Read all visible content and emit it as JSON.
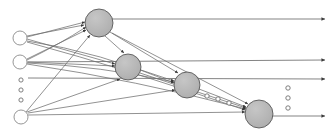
{
  "diagram": {
    "type": "neural-network-graph",
    "canvas": {
      "width": 335,
      "height": 132
    },
    "colors": {
      "background": "#ffffff",
      "hidden_node_fill": "#b4b4b4",
      "hidden_node_stroke": "#4a4a4a",
      "input_node_fill": "#ffffff",
      "input_node_stroke": "#8a8a8a",
      "edge_stroke": "#6e6e6e",
      "arrow_fill": "#3a3a3a",
      "ellipsis_stroke": "#707070"
    },
    "input_nodes": [
      {
        "id": "in1",
        "label": "",
        "cx": 20,
        "cy": 38,
        "r": 7
      },
      {
        "id": "in2",
        "label": "",
        "cx": 20,
        "cy": 62,
        "r": 7
      },
      {
        "id": "in3",
        "label": "",
        "cx": 21,
        "cy": 117,
        "r": 7
      }
    ],
    "input_ellipsis": [
      {
        "cx": 21,
        "cy": 80,
        "r": 2.1
      },
      {
        "cx": 21,
        "cy": 90,
        "r": 2.1
      },
      {
        "cx": 21,
        "cy": 100,
        "r": 2.1
      }
    ],
    "hidden_nodes": [
      {
        "id": "h1",
        "label": "",
        "cx": 99,
        "cy": 23,
        "r": 14
      },
      {
        "id": "h2",
        "label": "",
        "cx": 128,
        "cy": 67,
        "r": 13
      },
      {
        "id": "h3",
        "label": "",
        "cx": 187,
        "cy": 85,
        "r": 13
      },
      {
        "id": "h4",
        "label": "",
        "cx": 259,
        "cy": 114,
        "r": 14
      }
    ],
    "hidden_ellipsis": [
      {
        "cx": 207,
        "cy": 96,
        "r": 2.2
      },
      {
        "cx": 218,
        "cy": 99,
        "r": 2.2
      },
      {
        "cx": 229,
        "cy": 103,
        "r": 2.2
      }
    ],
    "output_ellipsis": [
      {
        "cx": 288,
        "cy": 88,
        "r": 2.2
      },
      {
        "cx": 288,
        "cy": 98,
        "r": 2.2
      },
      {
        "cx": 288,
        "cy": 108,
        "r": 2.2
      }
    ],
    "output_arrows": [
      {
        "id": "out1",
        "x1": 112,
        "y1": 19,
        "x2": 325,
        "y2": 19
      },
      {
        "id": "out2",
        "x1": 28,
        "y1": 62,
        "x2": 325,
        "y2": 60
      },
      {
        "id": "out3",
        "x1": 28,
        "y1": 78,
        "x2": 325,
        "y2": 79
      },
      {
        "id": "out4",
        "x1": 272,
        "y1": 116,
        "x2": 325,
        "y2": 116
      }
    ],
    "edges": [
      {
        "from": "in1",
        "to": "h1",
        "path": "M 27 36 L 84 25"
      },
      {
        "from": "in1",
        "to": "h2",
        "path": "M 27 39 L 115 64"
      },
      {
        "from": "in1",
        "to": "h3",
        "path": "M 27 41 Q 100 52 174 83"
      },
      {
        "from": "in1",
        "to": "h4",
        "path": "M 27 42 Q 130 70 245 110"
      },
      {
        "from": "in2",
        "to": "h1",
        "path": "M 27 59 L 86 30"
      },
      {
        "from": "in2",
        "to": "h2",
        "path": "M 27 62 L 115 66"
      },
      {
        "from": "in2",
        "to": "h3",
        "path": "M 27 63 Q 100 66 174 82"
      },
      {
        "from": "in2",
        "to": "h4",
        "path": "M 27 64 Q 135 80 246 109"
      },
      {
        "from": "in3",
        "to": "h1",
        "path": "M 26 112 L 90 35"
      },
      {
        "from": "in3",
        "to": "h2",
        "path": "M 27 112 L 120 79"
      },
      {
        "from": "in3",
        "to": "h3",
        "path": "M 28 113 L 175 90"
      },
      {
        "from": "in3",
        "to": "h4",
        "path": "M 28 115 L 245 112"
      },
      {
        "from": "h1",
        "to": "h2",
        "path": "M 105 36 L 124 53"
      },
      {
        "from": "h1",
        "to": "h3",
        "path": "M 110 32 L 178 73"
      },
      {
        "from": "h1",
        "to": "h4",
        "path": "M 112 33 L 248 104"
      },
      {
        "from": "h2",
        "to": "h3",
        "path": "M 141 70 L 174 81"
      },
      {
        "from": "h2",
        "to": "h4",
        "path": "M 140 73 L 246 108"
      },
      {
        "from": "h3",
        "to": "h4",
        "path": "M 199 89 L 246 107"
      },
      {
        "from": "in1",
        "to": "h1-alt",
        "path": "M 27 37 L 85 22"
      },
      {
        "from": "in2",
        "to": "h1-alt",
        "path": "M 27 60 Q 60 44 86 27"
      }
    ]
  }
}
